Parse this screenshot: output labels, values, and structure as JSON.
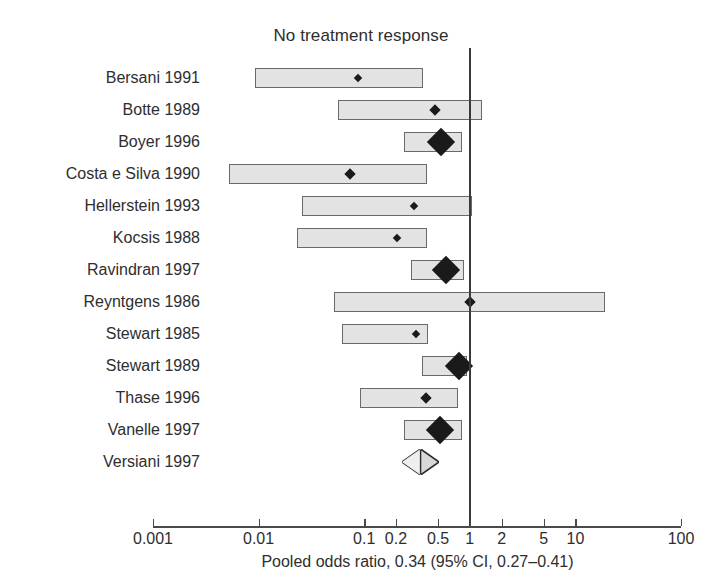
{
  "chart_data": {
    "type": "forest",
    "title": "No treatment response",
    "xlabel": "Pooled odds ratio, 0.34 (95% CI, 0.27–0.41)",
    "ylabel": "",
    "scale": "log",
    "xlim": [
      0.001,
      100
    ],
    "grid": false,
    "legend": "none",
    "null_value": 1,
    "xticks": [
      0.001,
      0.01,
      0.1,
      0.2,
      0.5,
      1,
      2,
      5,
      10,
      100
    ],
    "xticklabels": [
      "0.001",
      "0.01",
      "0.1",
      "0.2",
      "0.5",
      "1",
      "2",
      "5",
      "10",
      "100"
    ],
    "categories": [
      "Bersani 1991",
      "Botte 1989",
      "Boyer 1996",
      "Costa e Silva 1990",
      "Hellerstein 1993",
      "Kocsis 1988",
      "Ravindran 1997",
      "Reyntgens 1986",
      "Stewart 1985",
      "Stewart 1989",
      "Thase 1996",
      "Vanelle 1997",
      "Versiani 1997"
    ],
    "studies": [
      {
        "label": "Bersani 1991",
        "or": 0.086,
        "ci_low": 0.0092,
        "ci_high": 0.36,
        "marker": "tiny",
        "summary": false
      },
      {
        "label": "Botte 1989",
        "or": 0.46,
        "ci_low": 0.056,
        "ci_high": 1.31,
        "marker": "small",
        "summary": false
      },
      {
        "label": "Boyer 1996",
        "or": 0.52,
        "ci_low": 0.24,
        "ci_high": 0.85,
        "marker": "large",
        "summary": false
      },
      {
        "label": "Costa e Silva 1990",
        "or": 0.072,
        "ci_low": 0.0052,
        "ci_high": 0.39,
        "marker": "small",
        "summary": false
      },
      {
        "label": "Hellerstein 1993",
        "or": 0.29,
        "ci_low": 0.026,
        "ci_high": 1.05,
        "marker": "tiny",
        "summary": false
      },
      {
        "label": "Kocsis 1988",
        "or": 0.2,
        "ci_low": 0.023,
        "ci_high": 0.39,
        "marker": "tiny",
        "summary": false
      },
      {
        "label": "Ravindran 1997",
        "or": 0.58,
        "ci_low": 0.28,
        "ci_high": 0.88,
        "marker": "large",
        "summary": false
      },
      {
        "label": "Reyntgens 1986",
        "or": 0.98,
        "ci_low": 0.052,
        "ci_high": 19.0,
        "marker": "small",
        "summary": false
      },
      {
        "label": "Stewart 1985",
        "or": 0.3,
        "ci_low": 0.061,
        "ci_high": 0.4,
        "marker": "tiny",
        "summary": false
      },
      {
        "label": "Stewart 1989",
        "or": 0.77,
        "ci_low": 0.35,
        "ci_high": 0.95,
        "marker": "large",
        "summary": false
      },
      {
        "label": "Thase 1996",
        "or": 0.38,
        "ci_low": 0.091,
        "ci_high": 0.78,
        "marker": "small",
        "summary": false
      },
      {
        "label": "Vanelle 1997",
        "or": 0.51,
        "ci_low": 0.24,
        "ci_high": 0.85,
        "marker": "large",
        "summary": false
      },
      {
        "label": "Versiani 1997",
        "or": 0.34,
        "ci_low": 0.27,
        "ci_high": 0.41,
        "marker": "none",
        "summary": true
      }
    ]
  },
  "chart": {
    "title": "No treatment response",
    "caption": "Pooled odds ratio, 0.34 (95% CI, 0.27–0.41)"
  }
}
